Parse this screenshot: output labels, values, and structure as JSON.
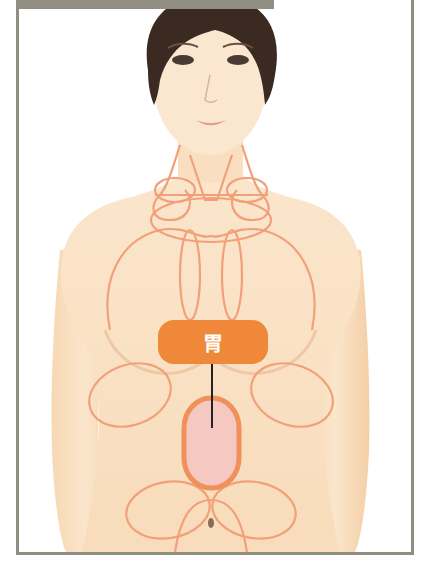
{
  "diagram": {
    "highlighted_organ": {
      "label": "胃",
      "meaning": "stomach",
      "label_color": "#f0883a",
      "organ_fill": "#f5c8c2",
      "organ_outline": "#f0905a"
    },
    "lymph_outline_color": "#f2a07a",
    "skin_color": "#fbe3c4",
    "hair_color": "#3a2a22",
    "frame_color": "#8f8e80"
  }
}
